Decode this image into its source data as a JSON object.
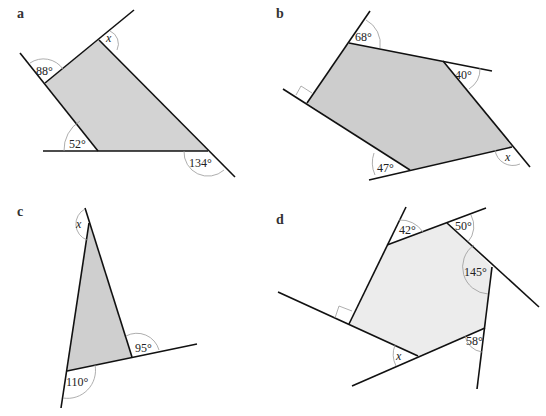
{
  "figures": [
    {
      "id": "a",
      "fill": "#d3d3d3",
      "angles": {
        "top_left": "88°",
        "top_right": "x",
        "bottom_left": "52°",
        "bottom_right": "134°"
      }
    },
    {
      "id": "b",
      "fill": "#cdcdcd",
      "angles": {
        "top": "68°",
        "right_top": "40°",
        "bottom_left": "47°",
        "bottom_right": "x",
        "left": "right-angle"
      }
    },
    {
      "id": "c",
      "fill": "#cfcfcf",
      "angles": {
        "top": "x",
        "right": "95°",
        "bottom_left": "110°"
      }
    },
    {
      "id": "d",
      "fill": "#ececec",
      "angles": {
        "top_left": "42°",
        "top_right": "50°",
        "right": "145°",
        "bottom_right": "58°",
        "bottom": "x",
        "left": "right-angle"
      }
    }
  ]
}
